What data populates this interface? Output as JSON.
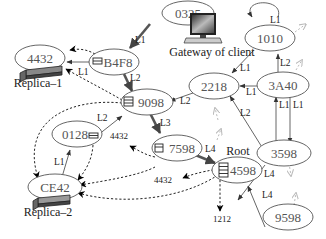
{
  "diagram": {
    "nodes": [
      {
        "id": "0325",
        "label": "0325"
      },
      {
        "id": "1010",
        "label": "1010"
      },
      {
        "id": "4432",
        "label": "4432"
      },
      {
        "id": "B4F8",
        "label": "B4F8"
      },
      {
        "id": "2218",
        "label": "2218"
      },
      {
        "id": "3A40",
        "label": "3A40"
      },
      {
        "id": "9098",
        "label": "9098"
      },
      {
        "id": "3598",
        "label": "3598"
      },
      {
        "id": "0128",
        "label": "0128"
      },
      {
        "id": "7598",
        "label": "7598"
      },
      {
        "id": "4598",
        "label": "4598"
      },
      {
        "id": "CE42",
        "label": "CE42"
      },
      {
        "id": "9598",
        "label": "9598"
      }
    ],
    "captions": {
      "gateway": "Gateway of client",
      "replica1": "Replica–1",
      "replica2": "Replica–2",
      "root": "Root"
    },
    "edge_labels": {
      "e_0325_b4f8": "L1",
      "e_1010_self": "L1",
      "e_1010_2218": "L1",
      "e_3a40_1010": "L2",
      "e_3a40_2218": "L1",
      "e_3598_3a40": "L1",
      "e_3a40_3598": "L1",
      "e_b4f8_4432": "L1",
      "e_b4f8_9098": "L2",
      "e_2218_9098": "L2",
      "e_3598_2218": "L2",
      "e_0128_9098": "L2",
      "e_9098_7598": "L3",
      "e_ce42_0128": "L1",
      "e_7598_4598": "L4",
      "e_3598_4598": "L4",
      "e_9598_4598": "L4"
    },
    "pointer_labels": {
      "p_7598_4432": "4432",
      "p_4598_4432": "4432",
      "p_4598_1212": "1212"
    }
  }
}
